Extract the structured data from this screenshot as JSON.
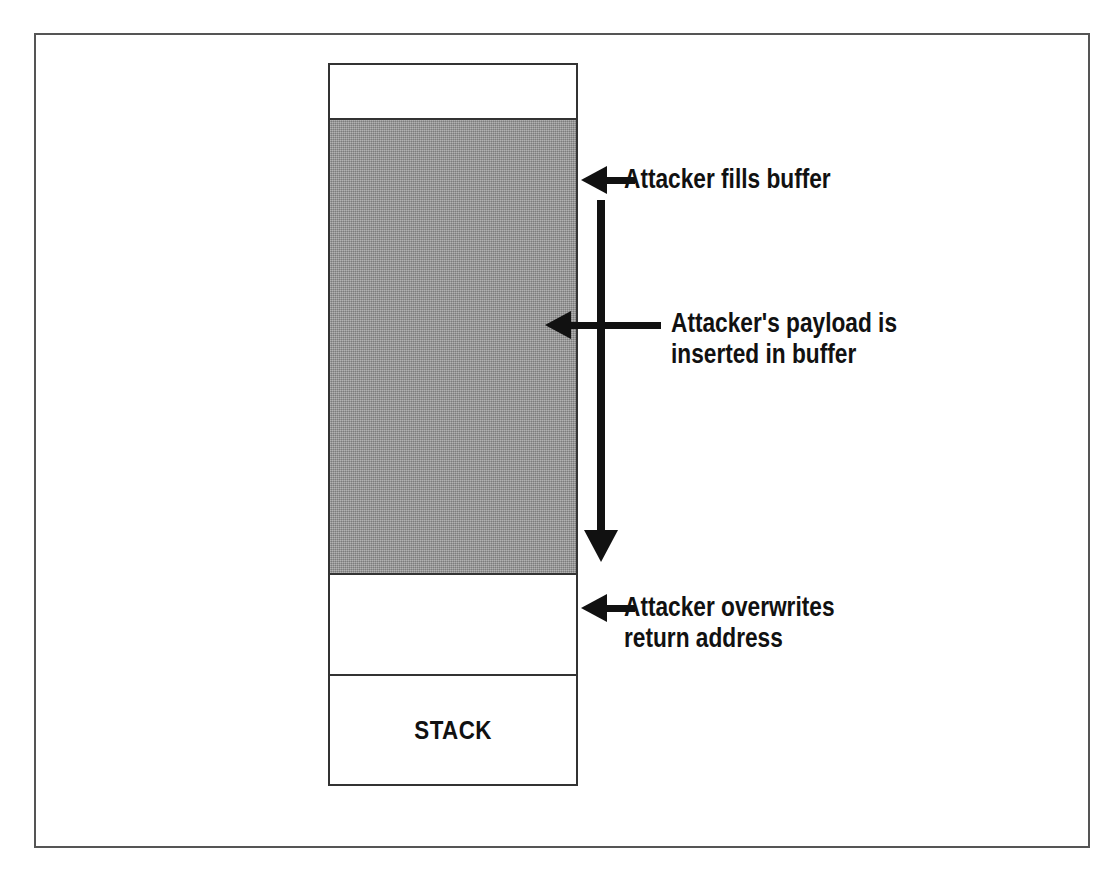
{
  "diagram": {
    "colors": {
      "frame": "#555555",
      "segment_border": "#333333",
      "buffer_fill": "#9a9a9a",
      "arrow": "#111111",
      "background": "#ffffff"
    },
    "memory_column": {
      "segments": [
        {
          "id": "free-top",
          "label": "",
          "fill": "white"
        },
        {
          "id": "buffer",
          "label": "",
          "fill": "gray"
        },
        {
          "id": "return-address",
          "label": "",
          "fill": "white"
        },
        {
          "id": "stack",
          "label": "STACK",
          "fill": "white"
        }
      ]
    },
    "annotations": [
      {
        "id": "fills-buffer",
        "icon": "left-arrow-icon",
        "lines": [
          "Attacker fills buffer"
        ],
        "text": "Attacker fills buffer"
      },
      {
        "id": "payload-inserted",
        "icon": "left-arrow-icon",
        "lines": [
          "Attacker's payload is",
          "inserted in buffer"
        ],
        "line1": "Attacker's payload is",
        "line2": "inserted in buffer"
      },
      {
        "id": "overwrites-return-address",
        "icon": "left-arrow-icon",
        "lines": [
          "Attacker overwrites",
          "return address"
        ],
        "line1": "Attacker overwrites",
        "line2": "return address"
      }
    ],
    "flow_arrow": {
      "icon": "down-arrow-icon",
      "description": "downward growth of attacker data through the buffer"
    }
  }
}
